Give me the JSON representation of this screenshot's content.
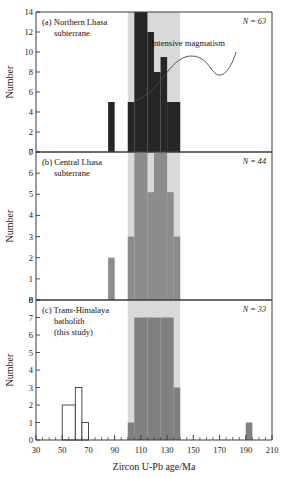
{
  "figure": {
    "xlabel": "Zircon U-Pb age/Ma",
    "ylabel": "Number",
    "annotation": "Intensive magmatism",
    "xlim": [
      30,
      210
    ],
    "xticks": [
      30,
      50,
      70,
      90,
      110,
      130,
      150,
      170,
      190,
      210
    ],
    "xtick_labels": [
      "30",
      "50",
      "70",
      "90",
      "110",
      "130",
      "150",
      "170",
      "190",
      "210"
    ],
    "minor_tick_step": 5,
    "highlight_band": {
      "start": 100,
      "end": 140,
      "color": "#d9d9d9",
      "label": "intensive magmatism band"
    }
  },
  "colors": {
    "black_bar": "#262626",
    "gray_bar": "#8c8c8c",
    "dark_gray_bar": "#808080",
    "white_bar": "#ffffff",
    "band": "#d9d9d9",
    "axis": "#3a3a3a"
  },
  "chart_data": [
    {
      "type": "bar",
      "panel": "a",
      "title": "(a) Northern Lhasa",
      "title_line2": "subterrane",
      "n_label": "N = 63",
      "ylabel": "Number",
      "xlabel": "Zircon U-Pb age/Ma",
      "ylim": [
        0,
        14
      ],
      "yticks": [
        0,
        2,
        4,
        6,
        8,
        10,
        12,
        14
      ],
      "ytick_labels": [
        "0",
        "2",
        "4",
        "6",
        "8",
        "10",
        "12",
        "14"
      ],
      "xlim": [
        30,
        210
      ],
      "grid": false,
      "bar_color": "#262626",
      "bins": [
        {
          "x0": 85,
          "x1": 90,
          "value": 5,
          "fill": "#262626"
        },
        {
          "x0": 100,
          "x1": 105,
          "value": 5,
          "fill": "#262626"
        },
        {
          "x0": 105,
          "x1": 115,
          "value": 14,
          "fill": "#262626"
        },
        {
          "x0": 115,
          "x1": 120,
          "value": 12,
          "fill": "#262626"
        },
        {
          "x0": 120,
          "x1": 125,
          "value": 8,
          "fill": "#262626"
        },
        {
          "x0": 125,
          "x1": 130,
          "value": 9.5,
          "fill": "#262626"
        },
        {
          "x0": 130,
          "x1": 140,
          "value": 5,
          "fill": "#262626"
        }
      ]
    },
    {
      "type": "bar",
      "panel": "b",
      "title": "(b) Central Lhasa",
      "title_line2": "subterrane",
      "n_label": "N = 44",
      "ylabel": "Number",
      "xlabel": "Zircon U-Pb age/Ma",
      "ylim": [
        0,
        7
      ],
      "yticks": [
        0,
        1,
        2,
        3,
        4,
        5,
        6,
        7
      ],
      "ytick_labels": [
        "0",
        "1",
        "2",
        "3",
        "4",
        "5",
        "6",
        "7"
      ],
      "xlim": [
        30,
        210
      ],
      "grid": false,
      "bar_color": "#8c8c8c",
      "bins": [
        {
          "x0": 85,
          "x1": 90,
          "value": 2,
          "fill": "#8c8c8c"
        },
        {
          "x0": 100,
          "x1": 105,
          "value": 3,
          "fill": "#8c8c8c"
        },
        {
          "x0": 105,
          "x1": 115,
          "value": 7,
          "fill": "#8c8c8c"
        },
        {
          "x0": 115,
          "x1": 120,
          "value": 5.1,
          "fill": "#8c8c8c"
        },
        {
          "x0": 120,
          "x1": 130,
          "value": 7,
          "fill": "#8c8c8c"
        },
        {
          "x0": 130,
          "x1": 135,
          "value": 5.1,
          "fill": "#8c8c8c"
        },
        {
          "x0": 135,
          "x1": 140,
          "value": 3,
          "fill": "#8c8c8c"
        }
      ]
    },
    {
      "type": "bar",
      "panel": "c",
      "title": "(c) Trans-Himalaya",
      "title_line2": "batholith",
      "title_line3": "(this study)",
      "n_label": "N = 33",
      "ylabel": "Number",
      "xlabel": "Zircon U-Pb age/Ma",
      "ylim": [
        0,
        8
      ],
      "yticks": [
        0,
        1,
        2,
        3,
        4,
        5,
        6,
        7,
        8
      ],
      "ytick_labels": [
        "0",
        "1",
        "2",
        "3",
        "4",
        "5",
        "6",
        "7",
        "8"
      ],
      "xlim": [
        30,
        210
      ],
      "grid": false,
      "bar_color": "#808080",
      "bins": [
        {
          "x0": 50,
          "x1": 60,
          "value": 2,
          "fill": "#ffffff"
        },
        {
          "x0": 60,
          "x1": 65,
          "value": 3,
          "fill": "#ffffff"
        },
        {
          "x0": 65,
          "x1": 70,
          "value": 1,
          "fill": "#ffffff"
        },
        {
          "x0": 100,
          "x1": 105,
          "value": 1,
          "fill": "#808080"
        },
        {
          "x0": 105,
          "x1": 115,
          "value": 7,
          "fill": "#808080"
        },
        {
          "x0": 115,
          "x1": 125,
          "value": 7,
          "fill": "#808080"
        },
        {
          "x0": 125,
          "x1": 135,
          "value": 7,
          "fill": "#808080"
        },
        {
          "x0": 135,
          "x1": 140,
          "value": 3,
          "fill": "#808080"
        },
        {
          "x0": 190,
          "x1": 195,
          "value": 1,
          "fill": "#808080"
        }
      ]
    }
  ]
}
